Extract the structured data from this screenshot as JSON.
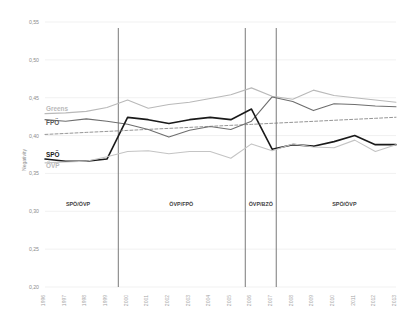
{
  "chart_data": {
    "type": "line",
    "title": "",
    "xlabel": "",
    "ylabel": "Negativity",
    "ylim": [
      0.2,
      0.55
    ],
    "ytick_labels": [
      "0,55",
      "0,50",
      "0,45",
      "0,40",
      "0,35",
      "0,30",
      "0,25",
      "0,20"
    ],
    "ytick_values": [
      0.55,
      0.5,
      0.45,
      0.4,
      0.35,
      0.3,
      0.25,
      0.2
    ],
    "grid": true,
    "legend_position": "inline-left",
    "categories": [
      "1996",
      "1997",
      "1998",
      "1999",
      "2000",
      "2001",
      "2002",
      "2003",
      "2004",
      "2005",
      "2006",
      "2007",
      "2008",
      "2009",
      "2010",
      "2011",
      "2012",
      "2013"
    ],
    "x": [
      1996,
      1997,
      1998,
      1999,
      2000,
      2001,
      2002,
      2003,
      2004,
      2005,
      2006,
      2007,
      2008,
      2009,
      2010,
      2011,
      2012,
      2013
    ],
    "series": [
      {
        "name": "Greens",
        "color": "#b9b9b9",
        "width": 1.1,
        "label_x": 1996,
        "label_y": 0.432,
        "values": [
          0.429,
          0.43,
          0.432,
          0.437,
          0.447,
          0.436,
          0.441,
          0.444,
          0.449,
          0.454,
          0.463,
          0.452,
          0.448,
          0.46,
          0.453,
          0.45,
          0.447,
          0.444
        ]
      },
      {
        "name": "FPÖ",
        "color": "#6e6e6e",
        "width": 1.1,
        "label_x": 1996,
        "label_y": 0.414,
        "values": [
          0.421,
          0.419,
          0.422,
          0.419,
          0.415,
          0.408,
          0.398,
          0.407,
          0.412,
          0.408,
          0.419,
          0.451,
          0.445,
          0.433,
          0.442,
          0.441,
          0.439,
          0.438
        ]
      },
      {
        "name": "SPÖ",
        "color": "#1a1a1a",
        "width": 1.6,
        "label_x": 1996,
        "label_y": 0.372,
        "values": [
          0.369,
          0.366,
          0.366,
          0.369,
          0.424,
          0.421,
          0.416,
          0.421,
          0.424,
          0.421,
          0.435,
          0.382,
          0.388,
          0.386,
          0.392,
          0.4,
          0.388,
          0.388
        ]
      },
      {
        "name": "ÖVP",
        "color": "#c4c4c4",
        "width": 1.1,
        "label_x": 1996,
        "label_y": 0.357,
        "values": [
          0.364,
          0.365,
          0.366,
          0.372,
          0.379,
          0.38,
          0.376,
          0.379,
          0.379,
          0.37,
          0.389,
          0.38,
          0.389,
          0.385,
          0.384,
          0.394,
          0.379,
          0.388
        ]
      }
    ],
    "trend_line": {
      "name": "trend",
      "style": "dashed",
      "color": "#7a7a7a",
      "values": [
        0.4015,
        0.4028,
        0.4042,
        0.4055,
        0.4068,
        0.4082,
        0.4095,
        0.4108,
        0.4122,
        0.4135,
        0.4148,
        0.4162,
        0.4175,
        0.4188,
        0.4202,
        0.4215,
        0.4228,
        0.4242
      ]
    },
    "dividers": [
      {
        "label": "1999/2000 boundary",
        "x": 1999.55
      },
      {
        "label": "2005/2006 boundary",
        "x": 2005.7
      },
      {
        "label": "2007 boundary",
        "x": 2007.2
      }
    ],
    "period_labels": [
      {
        "text": "SPÖ/ÖVP",
        "x": 1997.6
      },
      {
        "text": "ÖVP/FPÖ",
        "x": 2002.6
      },
      {
        "text": "ÖVP/BZÖ",
        "x": 2006.45
      },
      {
        "text": "SPÖ/ÖVP",
        "x": 2010.5
      }
    ]
  }
}
